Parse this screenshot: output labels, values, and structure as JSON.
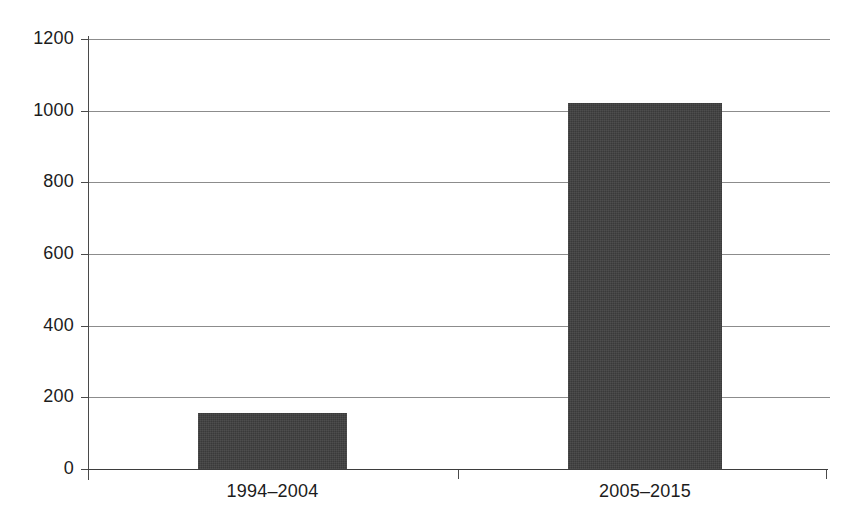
{
  "chart_data": {
    "type": "bar",
    "title": "",
    "subtitle": "",
    "xlabel": "",
    "ylabel": "",
    "categories": [
      "1994–2004",
      "2005–2015"
    ],
    "values": [
      155,
      1022
    ],
    "series": [
      {
        "name": "",
        "values": [
          155,
          1022
        ]
      }
    ],
    "ylim": [
      0,
      1200
    ],
    "yticks": [
      0,
      200,
      400,
      600,
      800,
      1000,
      1200
    ],
    "ytick_labels": [
      "0",
      "200",
      "400",
      "600",
      "800",
      "1000",
      "1200"
    ],
    "grid": true,
    "grid_axis": "y",
    "legend": false,
    "legend_position": "none",
    "annotations": [],
    "bar_color": "#3a3a3a",
    "gridline_color": "#8c8c8c",
    "axis_color": "#3d3d3d",
    "background_color": "#ffffff"
  }
}
